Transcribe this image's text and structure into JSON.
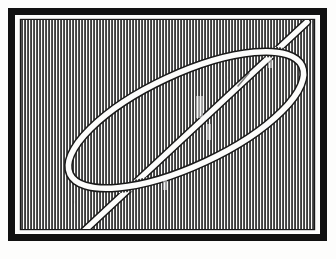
{
  "page": {
    "background_color": "#fdfdfc",
    "width": 336,
    "height": 259,
    "caption": ""
  },
  "plate": {
    "name": "framed-engraving",
    "medium": "wood engraving / line block",
    "ink_color": "#141414",
    "paper_color": "#fdfdfc",
    "frame": {
      "label": "rectangular ruled border",
      "outer_x": 11,
      "outer_y": 11,
      "outer_width": 313,
      "outer_height": 227,
      "band_thickness": 7,
      "inner_gap_thickness": 2,
      "gap_color": "#fbfbfa",
      "border_color": "#111111"
    },
    "hatching": {
      "label": "vertical line shading",
      "orientation": "vertical",
      "period_px": 3,
      "stroke_width_px": 1.5,
      "stroke_color": "#1b1b1b",
      "field_x": 21,
      "field_y": 20,
      "field_width": 293,
      "field_height": 209,
      "coverage": "full interior"
    },
    "subject": {
      "label": "cord loop with trailing end",
      "render_style": "reserved white line with fine dark outline",
      "cord_color": "#fcfcfb",
      "outline_color": "#1a1a1a",
      "cord_width_px": 6,
      "elements": [
        {
          "name": "ellipse-loop",
          "description": "elongated oval of cord, long axis tilted up to the right",
          "center_x": 186,
          "center_y": 120,
          "radius_x": 128,
          "radius_y": 46,
          "rotation_deg": -25
        },
        {
          "name": "trailing-end",
          "description": "straight length of cord running from lower-left corner up to upper-right corner, crossing the loop near its right end",
          "start_x": 84,
          "start_y": 231,
          "end_x": 307,
          "end_y": 22
        },
        {
          "name": "crossing-point",
          "description": "point where the trailing end passes beneath the loop",
          "x": 243,
          "y": 79
        }
      ]
    }
  }
}
